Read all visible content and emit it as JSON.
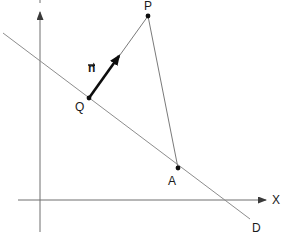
{
  "figure": {
    "title": "",
    "type": "geometry-diagram",
    "background": "#ffffff",
    "stroke_light": "#8a8a8a",
    "stroke_dark": "#111111",
    "axes": {
      "origin": [
        40,
        200
      ],
      "x_axis": {
        "label": "X",
        "from": [
          18,
          200
        ],
        "to": [
          270,
          200
        ],
        "label_pos": [
          275,
          194
        ]
      },
      "y_axis": {
        "label": "",
        "from": [
          40,
          232
        ],
        "to": [
          40,
          8
        ],
        "label_pos": [
          33,
          0
        ]
      }
    },
    "line_d": {
      "label": "D",
      "from": [
        3,
        33
      ],
      "to": [
        250,
        219
      ],
      "label_pos": [
        253,
        222
      ]
    },
    "points": [
      {
        "name": "P",
        "label": "P",
        "pos": [
          148,
          16
        ],
        "label_pos": [
          144,
          2
        ]
      },
      {
        "name": "Q",
        "label": "Q",
        "pos": [
          89,
          98
        ],
        "label_pos": [
          77,
          102
        ]
      },
      {
        "name": "A",
        "label": "A",
        "pos": [
          178,
          168
        ],
        "label_pos": [
          168,
          174
        ]
      }
    ],
    "vector": {
      "label": "n",
      "accent": "vector-arrow-overbar",
      "from": [
        89,
        98
      ],
      "to": [
        124,
        50
      ],
      "label_pos": [
        88,
        62
      ]
    },
    "segments": [
      {
        "name": "segment-p-to-q",
        "from": [
          148,
          16
        ],
        "to": [
          89,
          98
        ]
      },
      {
        "name": "segment-p-to-a",
        "from": [
          148,
          16
        ],
        "to": [
          178,
          168
        ]
      }
    ]
  }
}
